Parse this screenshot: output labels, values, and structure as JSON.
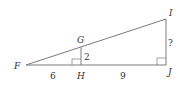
{
  "diagram": {
    "type": "similar right triangles",
    "vertices": {
      "F": {
        "label": "F",
        "x": 26,
        "y": 65
      },
      "G": {
        "label": "G",
        "x": 81,
        "y": 48
      },
      "H": {
        "label": "H",
        "x": 81,
        "y": 65
      },
      "I": {
        "label": "I",
        "x": 166,
        "y": 19
      },
      "J": {
        "label": "J",
        "x": 166,
        "y": 65
      }
    },
    "segments": [
      {
        "from": "F",
        "to": "J"
      },
      {
        "from": "F",
        "to": "I"
      },
      {
        "from": "G",
        "to": "H"
      },
      {
        "from": "I",
        "to": "J"
      }
    ],
    "measures": {
      "FH": "6",
      "HJ": "9",
      "GH": "2",
      "IJ": "?"
    },
    "right_angles": [
      "H",
      "J"
    ],
    "colors": {
      "line": "#7a7a7a",
      "text": "#333333",
      "background": "#ffffff"
    }
  }
}
